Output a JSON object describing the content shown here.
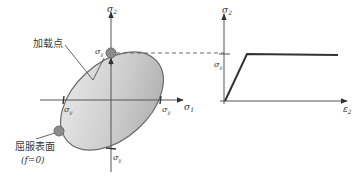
{
  "figure": {
    "left_plot": {
      "x_axis_label": "σ",
      "x_axis_sub": "1",
      "y_axis_label": "σ",
      "y_axis_sub": "2",
      "yield_labels": {
        "top": {
          "main": "σ",
          "sub": "y"
        },
        "left": {
          "main": "σ",
          "sub": "y"
        },
        "right": {
          "main": "σ",
          "sub": "y"
        },
        "bottom": {
          "main": "σ",
          "sub": "y"
        }
      },
      "loading_point_label": "加载点",
      "yield_surface_label": "屈服表面",
      "yield_surface_condition": "(f=0)",
      "colors": {
        "ellipse_fill_light": "#e6e6e6",
        "ellipse_fill_dark": "#b3b3b3",
        "ellipse_stroke": "#6b6b6b",
        "point_fill": "#8c8c8c"
      }
    },
    "right_plot": {
      "x_axis_label": "ε",
      "x_axis_sub": "2",
      "y_axis_label": "σ",
      "y_axis_sub": "2",
      "yield_label": {
        "main": "σ",
        "sub": "y"
      },
      "curve": "elastic-perfectly-plastic"
    }
  }
}
